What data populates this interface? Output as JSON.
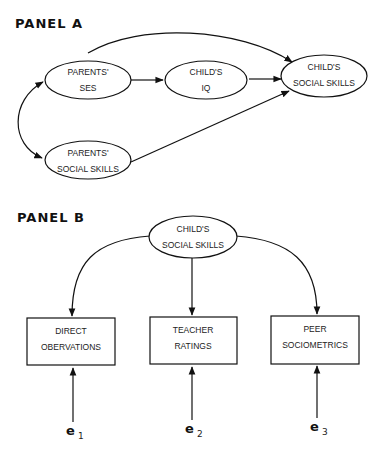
{
  "panel_a": {
    "title": "PANEL A",
    "nodes": {
      "parents_ses": {
        "line1": "PARENTS'",
        "line2": "SES"
      },
      "childs_iq": {
        "line1": "CHILD'S",
        "line2": "IQ"
      },
      "childs_social_skills": {
        "line1": "CHILD'S",
        "line2": "SOCIAL SKILLS"
      },
      "parents_social_skills": {
        "line1": "PARENTS'",
        "line2": "SOCIAL SKILLS"
      }
    },
    "edges": [
      {
        "from": "PARENTS' SES",
        "to": "CHILD'S IQ",
        "type": "directed"
      },
      {
        "from": "CHILD'S IQ",
        "to": "CHILD'S SOCIAL SKILLS",
        "type": "directed"
      },
      {
        "from": "PARENTS' SES",
        "to": "CHILD'S SOCIAL SKILLS",
        "type": "directed-curved"
      },
      {
        "from": "PARENTS' SOCIAL SKILLS",
        "to": "CHILD'S SOCIAL SKILLS",
        "type": "directed"
      },
      {
        "from": "PARENTS' SES",
        "to": "PARENTS' SOCIAL SKILLS",
        "type": "bidirectional-curved"
      }
    ]
  },
  "panel_b": {
    "title": "PANEL B",
    "latent": {
      "line1": "CHILD'S",
      "line2": "SOCIAL SKILLS"
    },
    "indicators": [
      {
        "line1": "DIRECT",
        "line2": "OBERVATIONS",
        "error": "e",
        "error_sub": "1"
      },
      {
        "line1": "TEACHER",
        "line2": "RATINGS",
        "error": "e",
        "error_sub": "2"
      },
      {
        "line1": "PEER",
        "line2": "SOCIOMETRICS",
        "error": "e",
        "error_sub": "3"
      }
    ]
  }
}
